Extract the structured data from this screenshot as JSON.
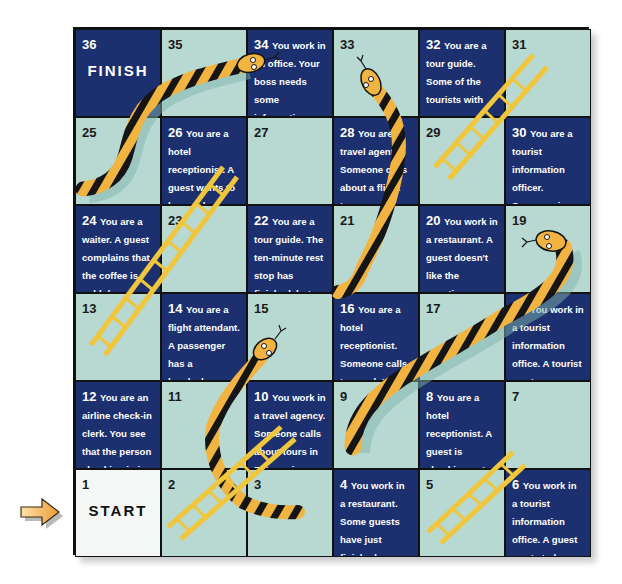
{
  "board": {
    "colors": {
      "dark": "#1c2f6e",
      "light": "#b7d9d2",
      "start": "#f4f7f6",
      "snake_body": "#f2b441",
      "snake_band": "#151515",
      "ladder": "#f0c63c",
      "arrow": "#f3b555"
    },
    "rows": [
      [
        {
          "num": "36",
          "label": "FINISH",
          "text": "",
          "tone": "dark"
        },
        {
          "num": "35",
          "text": "",
          "tone": "light"
        },
        {
          "num": "34",
          "text": "You work in an office. Your boss needs some information from your head office immediately. (fax)",
          "tone": "dark"
        },
        {
          "num": "33",
          "text": "",
          "tone": "light"
        },
        {
          "num": "32",
          "text": "You are a tour guide. Some of the tourists with you are interested in seeing the cathedral. (show)",
          "tone": "dark"
        },
        {
          "num": "31",
          "text": "",
          "tone": "light"
        }
      ],
      [
        {
          "num": "25",
          "text": "",
          "tone": "light"
        },
        {
          "num": "26",
          "text": "You are a hotel receptionist. A guest wants to know where she can change some money. (here)",
          "tone": "dark"
        },
        {
          "num": "27",
          "text": "",
          "tone": "light"
        },
        {
          "num": "28",
          "text": "You are a travel agent. Someone calls about a flight tomorrow morning to Paris. (reserve / seat)",
          "tone": "dark"
        },
        {
          "num": "29",
          "text": "",
          "tone": "light"
        },
        {
          "num": "30",
          "text": "You are a tourist information officer. Someone is asking about the cheapest hotel in your town. (make / reservation)",
          "tone": "dark"
        }
      ],
      [
        {
          "num": "24",
          "text": "You are a waiter. A guest complains that the coffee is cold. (another one)",
          "tone": "dark"
        },
        {
          "num": "23",
          "text": "",
          "tone": "light"
        },
        {
          "num": "22",
          "text": "You are a tour guide. The ten-minute rest stop has finished, but some tourists are not ready to leave. (give / extra ten minutes)",
          "tone": "dark"
        },
        {
          "num": "21",
          "text": "",
          "tone": "light"
        },
        {
          "num": "20",
          "text": "You work in a restaurant. A guest doesn't like the appetizer you gave him. (something else)",
          "tone": "dark"
        },
        {
          "num": "19",
          "text": "",
          "tone": "light"
        }
      ],
      [
        {
          "num": "13",
          "text": "",
          "tone": "light"
        },
        {
          "num": "14",
          "text": "You are a flight attendant. A passenger has a headache. (painkiller)",
          "tone": "dark"
        },
        {
          "num": "15",
          "text": "",
          "tone": "light"
        },
        {
          "num": "16",
          "text": "You are a hotel receptionist. Someone calls to speak to a guest who is out. (message)",
          "tone": "dark"
        },
        {
          "num": "17",
          "text": "",
          "tone": "light"
        },
        {
          "num": "18",
          "text": "You work in a tourist information office. A tourist wants some information about accommodations in another town. (call)",
          "tone": "dark"
        }
      ],
      [
        {
          "num": "12",
          "text": "You are an airline check-in clerk. You see that the person checking in is very tall. (seat with extra leg room)",
          "tone": "dark"
        },
        {
          "num": "11",
          "text": "",
          "tone": "light"
        },
        {
          "num": "10",
          "text": "You work in a travel agency. Someone calls about tours in Patagonia. (brochure)",
          "tone": "dark"
        },
        {
          "num": "9",
          "text": "",
          "tone": "light"
        },
        {
          "num": "8",
          "text": "You are a hotel receptionist. A guest is checking out. She wants to go to the airport. (taxi)",
          "tone": "dark"
        },
        {
          "num": "7",
          "text": "",
          "tone": "light"
        }
      ],
      [
        {
          "num": "1",
          "label": "START",
          "text": "",
          "tone": "white"
        },
        {
          "num": "2",
          "text": "",
          "tone": "light"
        },
        {
          "num": "3",
          "text": "",
          "tone": "light"
        },
        {
          "num": "4",
          "text": "You work in a restaurant. Some guests have just finished a bottle of wine. (another bottle)",
          "tone": "dark"
        },
        {
          "num": "5",
          "text": "",
          "tone": "light"
        },
        {
          "num": "6",
          "text": "You work in a tourist information office. A guest wants to know where the museum is. (map)",
          "tone": "dark"
        }
      ]
    ],
    "snakes": [
      {
        "from_square": "35",
        "to_square": "25"
      },
      {
        "from_square": "33",
        "to_square": "21"
      },
      {
        "from_square": "19",
        "to_square": "9"
      },
      {
        "from_square": "15",
        "to_square": "3"
      }
    ],
    "ladders": [
      {
        "from_square": "5",
        "to_square": "7"
      },
      {
        "from_square": "2",
        "to_square": "10"
      },
      {
        "from_square": "13",
        "to_square": "26"
      },
      {
        "from_square": "29",
        "to_square": "31"
      }
    ],
    "start_arrow": "arrow-right-icon"
  }
}
